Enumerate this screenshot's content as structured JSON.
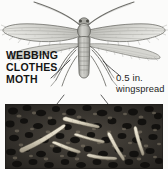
{
  "figure": {
    "name": "webbing-clothes-moth-figure",
    "background_color": "#fbfbfa"
  },
  "illustration": {
    "subject": "webbing clothes moth adult, dorsal view",
    "icon": "moth-illustration",
    "ink_color": "#4a4a4a",
    "wing_fill": "#cfcfcb"
  },
  "labels": {
    "left": {
      "line1": "WEBBING",
      "line2": "CLOTHES",
      "line3": "MOTH",
      "color": "#141414"
    },
    "right": {
      "line1": "0.5 in.",
      "line2": "wingspread",
      "color": "#1d1d1d"
    }
  },
  "leaders": {
    "left_leader": "leader-line-to-moth-body",
    "right_leader": "leader-line-to-wing-tip",
    "photo_leader_left": "leader-line-to-larvae-left",
    "photo_leader_right": "leader-line-to-larvae-right"
  },
  "photo": {
    "subject": "clothes moth larvae on fabric debris",
    "icon": "larvae-photograph",
    "background_color": "#2a2724",
    "larva_color": "#ded8c8",
    "larva_count": 7
  }
}
